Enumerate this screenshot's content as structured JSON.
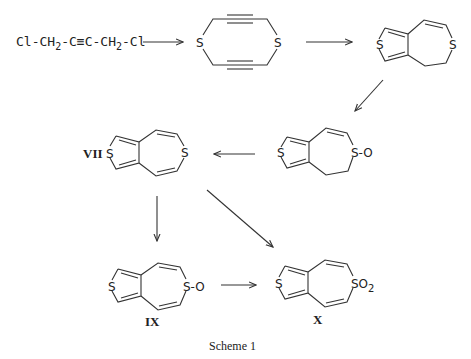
{
  "scheme": {
    "caption": "Scheme 1",
    "start_material": {
      "parts": [
        "Cl-CH",
        "2",
        "-C≡C-CH",
        "2",
        "-Cl"
      ]
    },
    "compounds": [
      {
        "id": "diyne-dithiacycle",
        "label": "",
        "atoms": [
          "S",
          "S"
        ]
      },
      {
        "id": "dihydro-thienothiepin",
        "label": "",
        "atoms": [
          "S",
          "S"
        ]
      },
      {
        "id": "dihydro-sulfoxide",
        "label": "",
        "atoms": [
          "S",
          "S-O"
        ]
      },
      {
        "id": "VII",
        "label": "VII",
        "atoms": [
          "S",
          "S"
        ]
      },
      {
        "id": "IX",
        "label": "IX",
        "atoms": [
          "S",
          "S-O"
        ]
      },
      {
        "id": "X",
        "label": "X",
        "atoms": [
          "S",
          "SO",
          "2"
        ]
      }
    ],
    "arrows": [
      {
        "from": "start_material",
        "to": "diyne-dithiacycle",
        "direction": "right"
      },
      {
        "from": "diyne-dithiacycle",
        "to": "dihydro-thienothiepin",
        "direction": "right"
      },
      {
        "from": "dihydro-thienothiepin",
        "to": "dihydro-sulfoxide",
        "direction": "down-left"
      },
      {
        "from": "dihydro-sulfoxide",
        "to": "VII",
        "direction": "left"
      },
      {
        "from": "VII",
        "to": "IX",
        "direction": "down"
      },
      {
        "from": "VII",
        "to": "X",
        "direction": "down-right"
      },
      {
        "from": "IX",
        "to": "X",
        "direction": "right"
      }
    ]
  }
}
